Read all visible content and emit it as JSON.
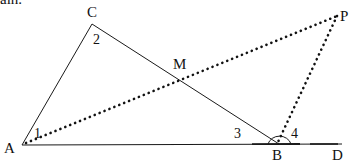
{
  "text_fragment": "ain.",
  "diagram": {
    "type": "geometry",
    "points": {
      "A": {
        "label": "A",
        "x": 22,
        "y": 145
      },
      "B": {
        "label": "B",
        "x": 279,
        "y": 144
      },
      "C": {
        "label": "C",
        "x": 92,
        "y": 24
      },
      "D": {
        "label": "D",
        "x": 342,
        "y": 144
      },
      "M": {
        "label": "M",
        "x": 180,
        "y": 78
      },
      "P": {
        "label": "P",
        "x": 337,
        "y": 16
      }
    },
    "angles": {
      "a1": "1",
      "a2": "2",
      "a3": "3",
      "a4": "4"
    },
    "solid_segments": [
      "AC",
      "CB",
      "AD"
    ],
    "dotted_segments": [
      "AP",
      "BP"
    ],
    "colors": {
      "stroke": "#1a1a1a",
      "background": "#ffffff"
    }
  }
}
